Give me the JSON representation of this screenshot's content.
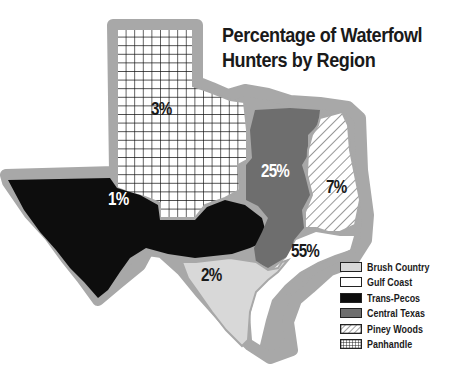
{
  "title": {
    "line1": "Percentage of Waterfowl",
    "line2": "Hunters by Region"
  },
  "regions": [
    {
      "name": "Panhandle",
      "label": "3%",
      "pattern": "grid",
      "color": "#ffffff"
    },
    {
      "name": "Trans-Pecos",
      "label": "1%",
      "pattern": "solid",
      "color": "#0d0d0d"
    },
    {
      "name": "Central Texas",
      "label": "25%",
      "pattern": "solid",
      "color": "#6e6e6e"
    },
    {
      "name": "Piney Woods",
      "label": "7%",
      "pattern": "hatch",
      "color": "#ffffff"
    },
    {
      "name": "Gulf Coast",
      "label": "55%",
      "pattern": "solid",
      "color": "#ffffff"
    },
    {
      "name": "Brush Country",
      "label": "2%",
      "pattern": "solid",
      "color": "#d8d8d8"
    }
  ],
  "legend": {
    "items": [
      {
        "label": "Brush Country",
        "pattern": "solid",
        "color": "#d8d8d8"
      },
      {
        "label": "Gulf Coast",
        "pattern": "solid",
        "color": "#ffffff"
      },
      {
        "label": "Trans-Pecos",
        "pattern": "solid",
        "color": "#0d0d0d"
      },
      {
        "label": "Central Texas",
        "pattern": "solid",
        "color": "#6e6e6e"
      },
      {
        "label": "Piney Woods",
        "pattern": "hatch",
        "color": "#ffffff"
      },
      {
        "label": "Panhandle",
        "pattern": "grid",
        "color": "#ffffff"
      }
    ]
  },
  "colors": {
    "border": "#a8a8a8",
    "outline": "#1a1a1a"
  }
}
